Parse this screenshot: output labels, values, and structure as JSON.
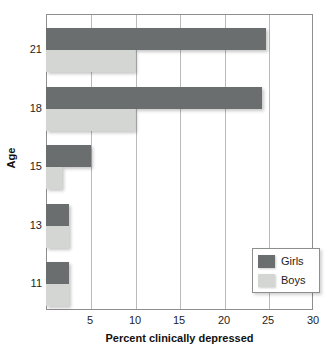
{
  "chart_data": {
    "type": "bar",
    "orientation": "horizontal",
    "title": "",
    "xlabel": "Percent clinically depressed",
    "ylabel": "Age",
    "categories": [
      "21",
      "18",
      "15",
      "13",
      "11"
    ],
    "series": [
      {
        "name": "Girls",
        "color": "#6a6e6e",
        "values": [
          24.7,
          24.3,
          5.0,
          2.6,
          2.6
        ]
      },
      {
        "name": "Boys",
        "color": "#d4d6d4",
        "values": [
          10.0,
          10.0,
          1.8,
          2.6,
          2.6
        ]
      }
    ],
    "xlim": [
      0,
      30
    ],
    "xticks": [
      5,
      10,
      15,
      20,
      25,
      30
    ],
    "xtick_labels": [
      "5",
      "10",
      "15",
      "20",
      "25",
      "30"
    ],
    "ytick_labels": [
      "21",
      "18",
      "15",
      "13",
      "11"
    ],
    "grid": "vertical",
    "legend_position": "bottom-right",
    "legend_entries": [
      "Girls",
      "Boys"
    ]
  },
  "axes": {
    "x_title": "Percent clinically depressed",
    "y_title": "Age"
  }
}
